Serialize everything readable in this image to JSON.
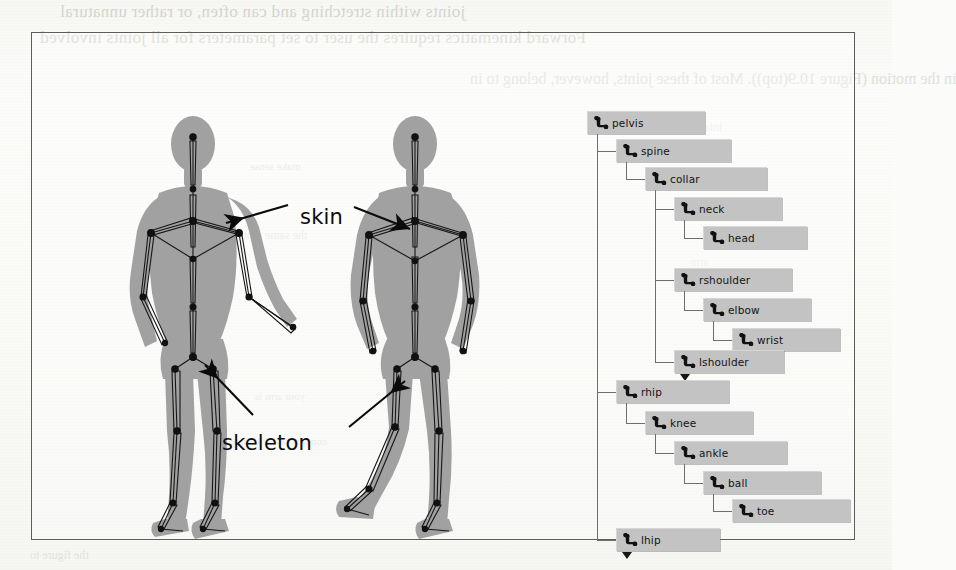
{
  "figure": {
    "caption_labels": {
      "skin": "skin",
      "skeleton": "skeleton"
    },
    "figure_alt_left": "humanoid-figure-front-skin-and-skeleton",
    "figure_alt_right": "humanoid-figure-back-skin-and-skeleton"
  },
  "joint_tree": {
    "title": "skeleton joint hierarchy",
    "nodes": [
      {
        "id": "pelvis",
        "label": "pelvis",
        "depth": 0,
        "top": 8,
        "width": 118,
        "collapse": false
      },
      {
        "id": "spine",
        "label": "spine",
        "depth": 1,
        "top": 36,
        "width": 115,
        "collapse": false
      },
      {
        "id": "collar",
        "label": "collar",
        "depth": 2,
        "top": 64,
        "width": 122,
        "collapse": false
      },
      {
        "id": "neck",
        "label": "neck",
        "depth": 3,
        "top": 94,
        "width": 108,
        "collapse": false
      },
      {
        "id": "head",
        "label": "head",
        "depth": 4,
        "top": 123,
        "width": 104,
        "collapse": false
      },
      {
        "id": "rshoulder",
        "label": "rshoulder",
        "depth": 3,
        "top": 165,
        "width": 118,
        "collapse": false
      },
      {
        "id": "elbow",
        "label": "elbow",
        "depth": 4,
        "top": 195,
        "width": 108,
        "collapse": false
      },
      {
        "id": "wrist",
        "label": "wrist",
        "depth": 5,
        "top": 225,
        "width": 108,
        "collapse": false
      },
      {
        "id": "lshoulder",
        "label": "lshoulder",
        "depth": 3,
        "top": 247,
        "width": 110,
        "collapse": true
      },
      {
        "id": "rhip",
        "label": "rhip",
        "depth": 1,
        "top": 277,
        "width": 113,
        "collapse": false
      },
      {
        "id": "knee",
        "label": "knee",
        "depth": 2,
        "top": 308,
        "width": 108,
        "collapse": false
      },
      {
        "id": "ankle",
        "label": "ankle",
        "depth": 3,
        "top": 338,
        "width": 113,
        "collapse": false
      },
      {
        "id": "ball",
        "label": "ball",
        "depth": 4,
        "top": 368,
        "width": 118,
        "collapse": false
      },
      {
        "id": "toe",
        "label": "toe",
        "depth": 5,
        "top": 396,
        "width": 118,
        "collapse": false
      },
      {
        "id": "lhip",
        "label": "lhip",
        "depth": 1,
        "top": 425,
        "width": 104,
        "collapse": true
      }
    ],
    "icon_name": "bone-joint-icon",
    "node_fill": "#c3c3c3",
    "line_color": "#6e6e6e"
  },
  "bleed_text": {
    "line1": "joints within stretching and can often, or rather unnatural",
    "line2": "Forward kinematics requires the user to set parameters for all joints involved",
    "line3": "in the motion (Figure 10.9(top)).  Most of these joints, however, belong to in",
    "line4": "make sense",
    "line5": "the same motion",
    "line6": "your arm is",
    "line7": "common environment",
    "line8": "the figure to",
    "line9": "inter",
    "line10": "arm"
  }
}
